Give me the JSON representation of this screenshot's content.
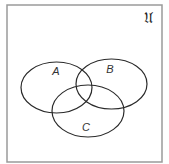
{
  "diagram": {
    "type": "venn",
    "universe": {
      "label": "𝔘",
      "border_color": "#9a9a9a",
      "rect": {
        "x": 7,
        "y": 5,
        "width": 155,
        "height": 157
      }
    },
    "sets": [
      {
        "id": "A",
        "label": "A",
        "cx": 56.5,
        "cy": 87.5,
        "rx": 35.5,
        "ry": 25.5,
        "label_x": 56,
        "label_y": 75
      },
      {
        "id": "B",
        "label": "B",
        "cx": 111.5,
        "cy": 84,
        "rx": 35.5,
        "ry": 25,
        "label_x": 110,
        "label_y": 73
      },
      {
        "id": "C",
        "label": "C",
        "cx": 88,
        "cy": 111,
        "rx": 36,
        "ry": 26,
        "label_x": 86,
        "label_y": 131
      }
    ],
    "stroke_color": "#2a2a2a"
  }
}
